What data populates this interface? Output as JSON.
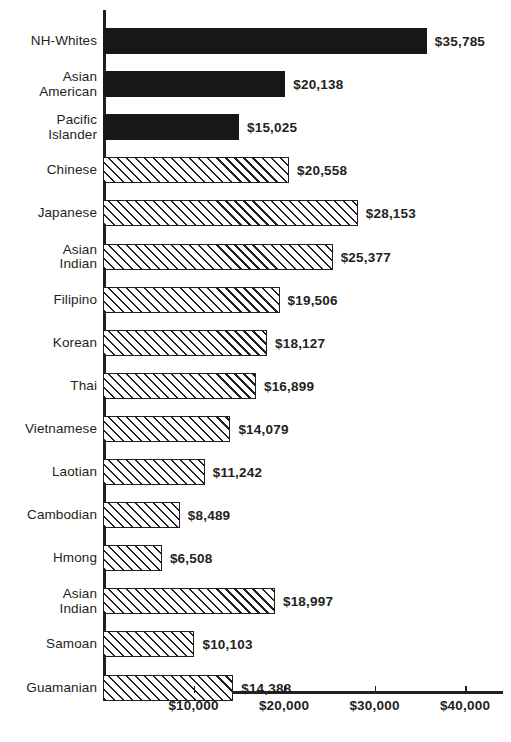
{
  "chart_data": {
    "type": "bar",
    "orientation": "horizontal",
    "title": "",
    "subtitle": "",
    "xlabel": "",
    "ylabel": "",
    "xlim": [
      0,
      44200
    ],
    "grid": false,
    "legend": null,
    "value_prefix": "$",
    "categories": [
      "NH-Whites",
      "Asian\nAmerican",
      "Pacific\nIslander",
      "Chinese",
      "Japanese",
      "Asian\nIndian",
      "Filipino",
      "Korean",
      "Thai",
      "Vietnamese",
      "Laotian",
      "Cambodian",
      "Hmong",
      "Asian\nIndian",
      "Samoan",
      "Guamanian"
    ],
    "values": [
      35785,
      20138,
      15025,
      20558,
      28153,
      25377,
      19506,
      18127,
      16899,
      14079,
      11242,
      8489,
      6508,
      18997,
      10103,
      14388
    ],
    "value_labels": [
      "$35,785",
      "$20,138",
      "$15,025",
      "$20,558",
      "$28,153",
      "$25,377",
      "$19,506",
      "$18,127",
      "$16,899",
      "$14,079",
      "$11,242",
      "$8,489",
      "$6,508",
      "$18,997",
      "$10,103",
      "$14,388"
    ],
    "bar_styles": [
      "solid",
      "solid",
      "solid",
      "hatch",
      "hatch",
      "hatch",
      "hatch",
      "hatch",
      "hatch",
      "hatch",
      "hatch",
      "hatch",
      "hatch",
      "hatch",
      "hatch",
      "hatch"
    ],
    "xticks": [
      10000,
      20000,
      30000,
      40000
    ],
    "xtick_labels": [
      "$10,000",
      "$20,000",
      "$30,000",
      "$40,000"
    ],
    "colors": {
      "solid_bar": "#171717",
      "hatch_line": "#231f20",
      "bar_face": "#ffffff",
      "axis": "#231f20",
      "text": "#231f20",
      "background": "#ffffff"
    }
  }
}
